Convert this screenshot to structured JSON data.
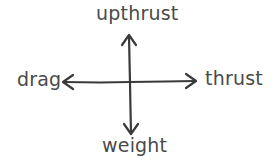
{
  "diagram": {
    "type": "force-diagram",
    "center": {
      "x": 130,
      "y": 82
    },
    "stroke_color": "#3a3a3a",
    "text_color": "#4a4a4a",
    "forces": [
      {
        "direction": "up",
        "label": "upthrust"
      },
      {
        "direction": "left",
        "label": "drag"
      },
      {
        "direction": "right",
        "label": "thrust"
      },
      {
        "direction": "down",
        "label": "weight"
      }
    ]
  }
}
